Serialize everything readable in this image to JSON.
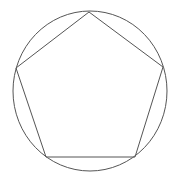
{
  "diagram": {
    "type": "inscribed-polygon",
    "stroke_color": "#555555",
    "background": "#ffffff",
    "circle": {
      "cx": 90,
      "cy": 91,
      "rx": 77,
      "ry": 80
    },
    "pentagon": {
      "vertices": [
        [
          89,
          12
        ],
        [
          163,
          67
        ],
        [
          135,
          157
        ],
        [
          46,
          157
        ],
        [
          16,
          68
        ]
      ]
    }
  }
}
